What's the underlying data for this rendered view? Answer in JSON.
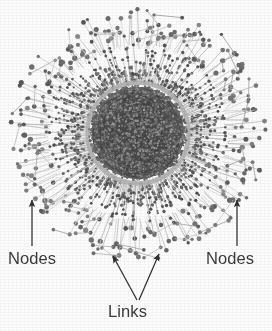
{
  "figure": {
    "width": 272,
    "height": 331,
    "background_color": "#fdfdfd",
    "alt_description": "Radial hub-and-spoke network diagram with dense dark core and node-tipped outer spokes"
  },
  "chart_data": {
    "type": "scatter",
    "title": "",
    "subtitle": "",
    "xlabel": "",
    "ylabel": "",
    "grid": false,
    "legend_position": "none",
    "rendering": "grayscale node-link radial network",
    "center": {
      "x": 138,
      "y": 133
    },
    "radii": {
      "core_outer": 46,
      "core_ring": 48,
      "mid_band_inner": 48,
      "mid_band_outer": 92,
      "fringe_outer": 128
    },
    "colors": {
      "node_dark": "#4a4a4a",
      "node_mid": "#6e6e6e",
      "node_light": "#9a9a9a",
      "link_light": "#cfcfcf",
      "link_mid": "#8c8c8c",
      "core_fill": "#3c3c3c",
      "background": "#fdfdfd",
      "label_text": "#3a3a3a",
      "arrow": "#2e2e2e"
    },
    "layers": [
      {
        "name": "core",
        "node_count": 1400,
        "r_min": 0,
        "r_max": 46,
        "node_radius": 1.05,
        "shade": "dark"
      },
      {
        "name": "core-ring",
        "node_count": 260,
        "r_min": 45,
        "r_max": 49,
        "node_radius": 1.35,
        "shade": "mid"
      },
      {
        "name": "mid-spokes",
        "spoke_count": 300,
        "r_min": 48,
        "r_max": 92,
        "node_radius": 1.6,
        "shade": "mid"
      },
      {
        "name": "outer-spokes",
        "spoke_count": 230,
        "r_min": 86,
        "r_max": 128,
        "node_radius": 2.1,
        "shade": "light"
      }
    ],
    "annotations": [
      {
        "id": "nodes-left",
        "text": "Nodes",
        "label_x": 8,
        "label_y": 250,
        "arrow_from": [
          32,
          246
        ],
        "arrow_to": [
          32,
          200
        ]
      },
      {
        "id": "nodes-right",
        "text": "Nodes",
        "label_x": 206,
        "label_y": 250,
        "arrow_from": [
          237,
          246
        ],
        "arrow_to": [
          237,
          200
        ]
      },
      {
        "id": "links",
        "text": "Links",
        "label_x": 108,
        "label_y": 303,
        "arrow_from": [
          137,
          300
        ],
        "arrow_to": [
          113,
          256
        ],
        "arrow2_from": [
          139,
          300
        ],
        "arrow2_to": [
          159,
          254
        ]
      }
    ]
  },
  "labels": {
    "nodes_left": "Nodes",
    "nodes_right": "Nodes",
    "links": "Links"
  }
}
